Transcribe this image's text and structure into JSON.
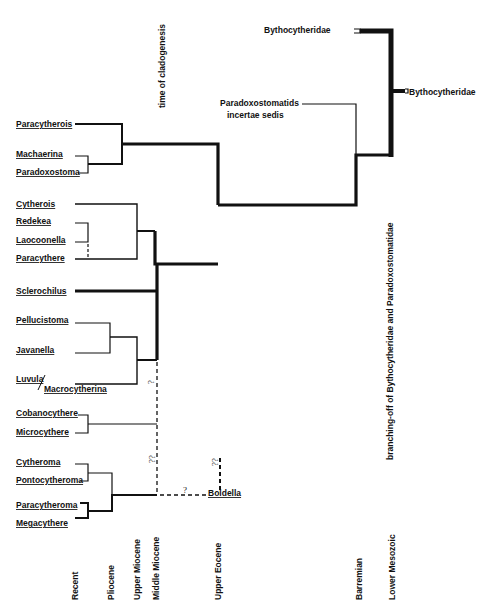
{
  "title_vertical": "time of cladogenesis",
  "branching_label": "branching-off of Bythocytheridae and Paradoxostomatidae",
  "taxa": {
    "paracytherois": "Paracytherois",
    "machaerina": "Machaerina",
    "paradoxostoma": "Paradoxostoma",
    "cytherois": "Cytherois",
    "redekea": "Redekea",
    "laocoonella": "Laocoonella",
    "paracythere": "Paracythere",
    "sclerochilus": "Sclerochilus",
    "pellucistoma": "Pellucistoma",
    "javanella": "Javanella",
    "luvula": "Luvula",
    "macrocytherina": "Macrocytherina",
    "cobanocythere": "Cobanocythere",
    "microcythere": "Microcythere",
    "cytheroma": "Cytheroma",
    "pontocytheroma": "Pontocytheroma",
    "paracytheroma": "Paracytheroma",
    "megacythere": "Megacythere",
    "boldella": "Boldella",
    "bythocytheridae_top": "Bythocytheridae",
    "bythocytheridae_right": "Bythocytheridae",
    "paradoxostomatids_line1": "Paradoxostomatids",
    "paradoxostomatids_line2": "incertae  sedis"
  },
  "uncertainty_marks": {
    "q1": "?",
    "q2": "??",
    "q3": "?",
    "q4": "??"
  },
  "time_axis": {
    "ticks": [
      "Recent",
      "Pliocene",
      "Upper Miocene",
      "Middle Miocene",
      "Upper Eocene",
      "Barremian",
      "Lower Mesozoic"
    ]
  }
}
